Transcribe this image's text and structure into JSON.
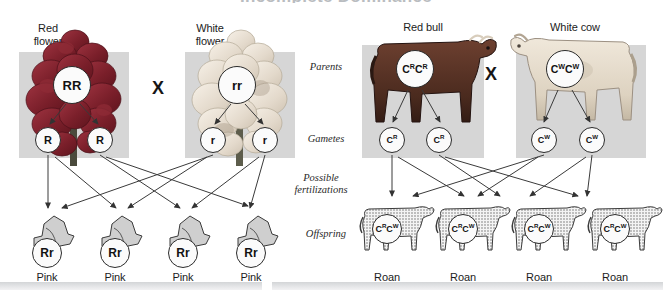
{
  "title": {
    "text": "Incomplete Dominance"
  },
  "stage_labels": [
    {
      "name": "parents",
      "text": "Parents"
    },
    {
      "name": "gametes",
      "text": "Gametes"
    },
    {
      "name": "possible-fertilizations",
      "text": "Possible\nfertilizations"
    },
    {
      "name": "offspring",
      "text": "Offspring"
    }
  ],
  "left_panel": {
    "name": "snapdragon-cross",
    "cross_symbol": "X",
    "parents": [
      {
        "label": "Red\nflower",
        "genotype": "RR",
        "color": "#8c2630"
      },
      {
        "label": "White\nflower",
        "genotype": "rr",
        "color": "#efe6dc"
      }
    ],
    "gametes": [
      {
        "allele": "R"
      },
      {
        "allele": "R"
      },
      {
        "allele": "r"
      },
      {
        "allele": "r"
      }
    ],
    "offspring": [
      {
        "genotype": "Rr",
        "phenotype": "Pink"
      },
      {
        "genotype": "Rr",
        "phenotype": "Pink"
      },
      {
        "genotype": "Rr",
        "phenotype": "Pink"
      },
      {
        "genotype": "Rr",
        "phenotype": "Pink"
      }
    ]
  },
  "right_panel": {
    "name": "cattle-cross",
    "cross_symbol": "X",
    "parents": [
      {
        "label": "Red bull",
        "allele1": "C",
        "sup1": "R",
        "allele2": "C",
        "sup2": "R",
        "color": "#6b3a27"
      },
      {
        "label": "White cow",
        "allele1": "C",
        "sup1": "W",
        "allele2": "C",
        "sup2": "W",
        "color": "#e4dbcd"
      }
    ],
    "gametes": [
      {
        "allele": "C",
        "sup": "R"
      },
      {
        "allele": "C",
        "sup": "R"
      },
      {
        "allele": "C",
        "sup": "W"
      },
      {
        "allele": "C",
        "sup": "W"
      }
    ],
    "offspring": [
      {
        "allele1": "C",
        "sup1": "R",
        "allele2": "C",
        "sup2": "W",
        "phenotype": "Roan"
      },
      {
        "allele1": "C",
        "sup1": "R",
        "allele2": "C",
        "sup2": "W",
        "phenotype": "Roan"
      },
      {
        "allele1": "C",
        "sup1": "R",
        "allele2": "C",
        "sup2": "W",
        "phenotype": "Roan"
      },
      {
        "allele1": "C",
        "sup1": "R",
        "allele2": "C",
        "sup2": "W",
        "phenotype": "Roan"
      }
    ]
  },
  "colors": {
    "tint": "#d6d6d6",
    "band": "#d3d5d7",
    "arrow": "#3a3a3a",
    "text": "#1c1c1c"
  }
}
